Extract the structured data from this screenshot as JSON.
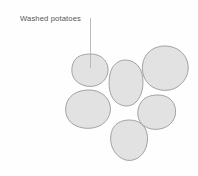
{
  "illustration": {
    "title": "Washed potatoes illustration",
    "background_color": "#fefefe",
    "width": 198,
    "height": 176
  },
  "callout": {
    "label": "Washed potatoes",
    "text_color": "#555555",
    "text_x": 20,
    "text_y": 21,
    "leader_line": {
      "color": "#b4b4b4",
      "x1": 90.5,
      "y1": 18,
      "x2": 90.5,
      "y2": 68
    }
  },
  "shapes": {
    "fill_color": "#e2e2e2",
    "stroke_color": "#9a9a9a",
    "count": 6,
    "items": [
      {
        "name": "potato-top-left",
        "label": "Washed potato (labelled)",
        "path": "M 90 54 C 100 53.5 107 60 108 68 C 108.8 76 104 83 96 85.6 C 88 88 79 85 74.5 79 C 70.5 73.5 71 64 76 58.5 C 79.8 55 85 54.2 90 54 Z"
      },
      {
        "name": "potato-top-right",
        "label": "Washed potato",
        "path": "M 166 46 C 177 46.5 185 53 187.5 62 C 190 71.5 186 81 178 86.5 C 170 92 159 91.5 151 86 C 143.5 80.5 140.5 70 143.5 60.5 C 146.5 51.5 155 45.6 166 46 Z"
      },
      {
        "name": "potato-middle",
        "label": "Washed potato",
        "path": "M 126 60 C 135 60.5 141 67 142.5 76 C 144 86 142 96 136 102 C 130 108 121 107 115 101 C 109 95 108 84 110 74 C 112 65 118.5 59.6 126 60 Z"
      },
      {
        "name": "potato-left-lower",
        "label": "Washed potato",
        "path": "M 89 90 C 100 90 108 96.5 110 105 C 112 114 107 123 98 126.5 C 89 130 77 128.5 70.5 122 C 64.5 116 64 105.5 69 98.5 C 73.5 92.5 81 90 89 90 Z"
      },
      {
        "name": "potato-right-lower",
        "label": "Washed potato",
        "path": "M 158 95 C 168 95 174.5 101 175.5 109.5 C 176.5 118.5 171 126 162 128.5 C 153 131 144 128 140 121.5 C 136 115 137.5 105 143.5 99.5 C 147.5 96 152.5 95 158 95 Z"
      },
      {
        "name": "potato-bottom-center",
        "label": "Washed potato",
        "path": "M 136 121 C 144 123.5 148 131 147.5 140 C 147 150 141 158 133 160 C 125 162 117 157 113 149 C 109 141 110 130 116 124.5 C 121 120 129.5 119 136 121 Z"
      }
    ]
  }
}
